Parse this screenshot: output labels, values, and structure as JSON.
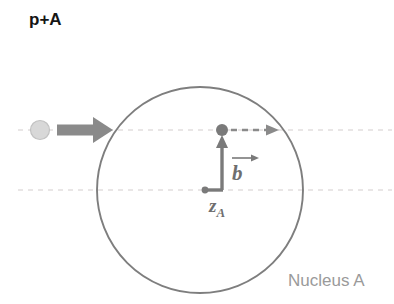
{
  "figure": {
    "title": "p+A",
    "caption": "Nucleus A",
    "labels": {
      "impact_parameter": "b",
      "longitudinal_coordinate_base": "z",
      "longitudinal_coordinate_sub": "A"
    },
    "colors": {
      "background": "#ffffff",
      "title_text": "#151515",
      "caption_text": "#9a9a9a",
      "nucleus_outline": "#7e7e7e",
      "arrow_gray": "#8a8a8a",
      "vector_gray": "#6e6e6e",
      "projectile_fill": "#d8d8d8",
      "projectile_stroke": "#bdbdbd",
      "dashed_guide": "#e2dede",
      "label_text": "#6e6e6e"
    },
    "geometry": {
      "nucleus_center_x": 200,
      "nucleus_center_y": 190,
      "nucleus_radius": 103,
      "beam_axis_y": 130,
      "center_axis_y": 190,
      "projectile_x": 40,
      "projectile_y": 130,
      "projectile_radius": 10,
      "interaction_point_x": 222,
      "interaction_point_y": 130,
      "interaction_point_radius": 6
    }
  }
}
